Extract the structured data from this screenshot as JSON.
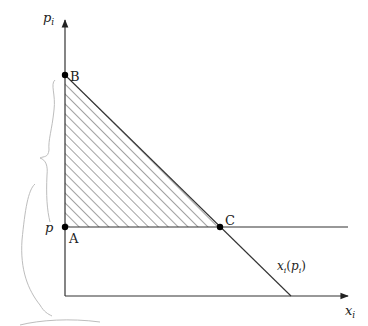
{
  "diagram": {
    "type": "consumer-surplus-demand",
    "axes": {
      "y_label": "p",
      "y_label_sub": "i",
      "x_label": "x",
      "x_label_sub": "i"
    },
    "price_label": "p",
    "points": {
      "A": "A",
      "B": "B",
      "C": "C"
    },
    "curve_label": {
      "main": "x",
      "sub": "i",
      "open": "(",
      "arg": "p",
      "arg_sub": "i",
      "close": ")"
    },
    "colors": {
      "line": "#333333",
      "hatch": "#555555",
      "pencil": "#b8b8b8",
      "point": "#000000"
    }
  }
}
